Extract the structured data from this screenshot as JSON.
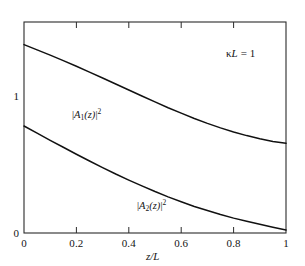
{
  "figure": {
    "background_color": "#ffffff",
    "frame_color": "#2b2b2b",
    "curve_color": "#111111"
  },
  "annotation": {
    "text": "κL = 1",
    "kappa": "κ",
    "L": "L",
    "equals_value": "= 1"
  },
  "axes": {
    "x_title": "z/L",
    "x_title_parts": {
      "numerator": "z",
      "slash": "/",
      "denominator": "L"
    },
    "y_title": "",
    "x_ticks": [
      "0",
      "0.2",
      "0.4",
      "0.6",
      "0.8",
      "1"
    ],
    "x_tick_values": [
      0,
      0.2,
      0.4,
      0.6,
      0.8,
      1
    ],
    "y_ticks": [
      "0",
      "1"
    ],
    "y_tick_values": [
      0,
      1
    ]
  },
  "curve_labels": {
    "curve1": {
      "prefix": "|",
      "symbol": "A",
      "sub": "1",
      "arg": "(z)",
      "suffix": "|",
      "sup": "2",
      "full": "|A₁(z)|²"
    },
    "curve2": {
      "prefix": "|",
      "symbol": "A",
      "sub": "2",
      "arg": "(z)",
      "suffix": "|",
      "sup": "2",
      "full": "|A₂(z)|²"
    }
  },
  "chart_data": {
    "type": "line",
    "title": "",
    "xlabel": "z/L",
    "ylabel": "",
    "xlim": [
      0,
      1
    ],
    "ylim": [
      0,
      1.12
    ],
    "grid": false,
    "legend": "inline-curve-labels",
    "annotations": [
      {
        "text": "κL = 1",
        "x": 0.78,
        "y": 1.0
      },
      {
        "text": "|A₁(z)|²",
        "x": 0.26,
        "y": 0.79
      },
      {
        "text": "|A₂(z)|²",
        "x": 0.54,
        "y": 0.27
      }
    ],
    "x": [
      0,
      0.05,
      0.1,
      0.15,
      0.2,
      0.25,
      0.3,
      0.35,
      0.4,
      0.45,
      0.5,
      0.55,
      0.6,
      0.65,
      0.7,
      0.75,
      0.8,
      0.85,
      0.9,
      0.95,
      1
    ],
    "series": [
      {
        "name": "|A1(z)|^2",
        "values": [
          1.0,
          0.972,
          0.944,
          0.915,
          0.885,
          0.854,
          0.823,
          0.791,
          0.759,
          0.727,
          0.696,
          0.665,
          0.636,
          0.608,
          0.582,
          0.558,
          0.536,
          0.517,
          0.5,
          0.486,
          0.476
        ]
      },
      {
        "name": "|A2(z)|^2",
        "values": [
          0.568,
          0.53,
          0.492,
          0.455,
          0.418,
          0.382,
          0.347,
          0.313,
          0.281,
          0.25,
          0.22,
          0.192,
          0.166,
          0.141,
          0.119,
          0.098,
          0.079,
          0.062,
          0.046,
          0.031,
          0.016
        ]
      }
    ]
  },
  "geometry": {
    "plot_left": 24,
    "plot_right": 286,
    "plot_top": 22,
    "plot_bottom": 233
  }
}
